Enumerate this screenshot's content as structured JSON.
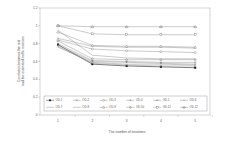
{
  "chart_data": {
    "type": "line",
    "title": "",
    "xlabel": "The number of iterations",
    "ylabel": "Correlation between the real and the estimated traffic matrices",
    "ylabel_lines": [
      "Correlation between the real",
      "and the estimated traffic matrices"
    ],
    "x": [
      1,
      2,
      3,
      4,
      5
    ],
    "x_tick_labels": [
      "1",
      "2",
      "3",
      "4",
      "5"
    ],
    "ylim": [
      0,
      1.2
    ],
    "y_ticks": [
      0,
      0.2,
      0.4,
      0.6,
      0.8,
      1,
      1.2
    ],
    "y_tick_labels": [
      "0",
      "0.2",
      "0.4",
      "0.6",
      "0.8",
      "1",
      "1.2"
    ],
    "grid": false,
    "legend_position": "inside-bottom",
    "series": [
      {
        "name": "OD-1",
        "marker": "filled-square",
        "values": [
          0.79,
          0.57,
          0.55,
          0.54,
          0.53
        ]
      },
      {
        "name": "OD-2",
        "marker": "x",
        "values": [
          0.77,
          0.58,
          0.56,
          0.55,
          0.55
        ]
      },
      {
        "name": "OD-3",
        "marker": "circle",
        "values": [
          0.84,
          0.74,
          0.72,
          0.71,
          0.7
        ]
      },
      {
        "name": "OD-4",
        "marker": "plus",
        "values": [
          0.8,
          0.61,
          0.6,
          0.59,
          0.59
        ]
      },
      {
        "name": "OD-5",
        "marker": "asterisk",
        "values": [
          0.78,
          0.6,
          0.59,
          0.58,
          0.57
        ]
      },
      {
        "name": "OD-6",
        "marker": "dash",
        "values": [
          0.86,
          0.77,
          0.76,
          0.76,
          0.75
        ]
      },
      {
        "name": "OD-7",
        "marker": "none",
        "values": [
          0.95,
          0.67,
          0.64,
          0.63,
          0.63
        ]
      },
      {
        "name": "OD-8",
        "marker": "none",
        "values": [
          0.76,
          0.59,
          0.57,
          0.57,
          0.56
        ]
      },
      {
        "name": "OD-9",
        "marker": "triangle",
        "values": [
          0.93,
          0.78,
          0.77,
          0.77,
          0.76
        ]
      },
      {
        "name": "OD-10",
        "marker": "circle-plus",
        "values": [
          0.83,
          0.63,
          0.62,
          0.62,
          0.62
        ]
      },
      {
        "name": "OD-11",
        "marker": "square",
        "values": [
          1.0,
          0.91,
          0.9,
          0.9,
          0.9
        ]
      },
      {
        "name": "OD-12",
        "marker": "triangle-plus",
        "values": [
          1.0,
          0.99,
          0.99,
          0.99,
          0.99
        ]
      }
    ]
  },
  "colors": {
    "axis": "#888888",
    "line": "#8a8a8a",
    "dark_line": "#222222",
    "text": "#555555"
  }
}
